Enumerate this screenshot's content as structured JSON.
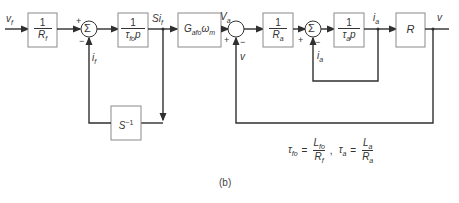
{
  "diagram": {
    "caption": "(b)",
    "signals": {
      "input": "v_f",
      "if_feedback": "i_f",
      "sif": "Si_f",
      "va": "V_a",
      "v_feedback": "v",
      "ia_feedback": "i_a",
      "ia": "i_a",
      "output": "v"
    },
    "blocks": [
      {
        "id": "rf",
        "num": "1",
        "den": "R_f"
      },
      {
        "id": "tfo",
        "num": "1",
        "den": "τ_fo p"
      },
      {
        "id": "gain",
        "text": "G_afo ω_m"
      },
      {
        "id": "ra",
        "num": "1",
        "den": "R_a"
      },
      {
        "id": "ta",
        "num": "1",
        "den": "τ_a p"
      },
      {
        "id": "r",
        "text": "R"
      },
      {
        "id": "sinv",
        "text": "S⁻¹"
      }
    ],
    "summing_junctions": [
      {
        "id": "sum1",
        "symbol": "Σ",
        "signs": [
          "+",
          "−"
        ]
      },
      {
        "id": "sum2",
        "symbol": "",
        "signs": [
          "+",
          "−"
        ]
      },
      {
        "id": "sum3",
        "symbol": "Σ",
        "signs": [
          "+",
          "−"
        ]
      }
    ],
    "equations": {
      "tau_fo": {
        "lhs": "τ_fo",
        "num": "L_fo",
        "den": "R_f"
      },
      "tau_a": {
        "lhs": "τ_a",
        "num": "L_a",
        "den": "R_a"
      }
    }
  },
  "display": {
    "vf": "v",
    "vf_sub": "f",
    "if": "i",
    "if_sub": "f",
    "sif": "Si",
    "sif_sub": "f",
    "va": "V",
    "va_sub": "a",
    "v_fb": "v",
    "ia_fb": "i",
    "ia_fb_sub": "a",
    "ia": "i",
    "ia_sub": "a",
    "vout": "v",
    "one": "1",
    "rf": "R",
    "rf_sub": "f",
    "tfo": "τ",
    "tfo_sub": "fo",
    "p": "p",
    "gain": "G",
    "gain_sub": "afo",
    "omega": "ω",
    "omega_sub": "m",
    "ra": "R",
    "ra_sub": "a",
    "ta": "τ",
    "ta_sub": "a",
    "r": "R",
    "sinv": "S",
    "sinv_sup": "−1",
    "sigma": "Σ",
    "plus": "+",
    "minus": "−",
    "eq1_lhs": "τ",
    "eq1_lhs_sub": "fo",
    "eq1_num": "L",
    "eq1_num_sub": "fo",
    "eq1_den": "R",
    "eq1_den_sub": "f",
    "eq2_lhs": "τ",
    "eq2_lhs_sub": "a",
    "eq2_num": "L",
    "eq2_num_sub": "a",
    "eq2_den": "R",
    "eq2_den_sub": "a",
    "equals": "=",
    "comma": ",",
    "caption": "(b)"
  }
}
